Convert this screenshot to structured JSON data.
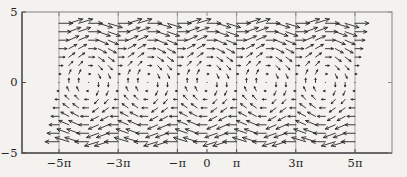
{
  "figure": {
    "width": 407,
    "height": 177,
    "background": "#f3f2ef",
    "plot_box": {
      "left": 22,
      "top": 12,
      "right": 392,
      "bottom": 153
    },
    "colors": {
      "arrow": "#262626",
      "grid": "#9b9b9b",
      "box_light": "#8c8c8c",
      "box_dark": "#4d4d4d",
      "label": "#1f1f1f"
    },
    "tick_length_px": 4,
    "label_font_px": 11.5
  },
  "chart_data": {
    "type": "quiver",
    "title": "",
    "xlabel": "",
    "ylabel": "",
    "field": {
      "u_expr": "y",
      "v_expr": "-sin(x)"
    },
    "grid": {
      "x_start_pi": -5,
      "x_step_pi": 0.33333333,
      "x_count": 31,
      "y_start": -4.2,
      "y_step": 0.6,
      "y_count": 15
    },
    "xlim_pi": [
      -6.25,
      6.25
    ],
    "ylim": [
      -5,
      5
    ],
    "x_ticks": [
      {
        "label": "−5π",
        "value_pi": -5
      },
      {
        "label": "−3π",
        "value_pi": -3
      },
      {
        "label": "−π",
        "value_pi": -1
      },
      {
        "label": "0",
        "value_pi": 0
      },
      {
        "label": "π",
        "value_pi": 1
      },
      {
        "label": "3π",
        "value_pi": 3
      },
      {
        "label": "5π",
        "value_pi": 5
      }
    ],
    "y_ticks": [
      {
        "label": "5",
        "value": 5
      },
      {
        "label": "0",
        "value": 0
      },
      {
        "label": "−5",
        "value": -5
      }
    ],
    "x_gridlines_pi": [
      -5,
      -3,
      -1,
      1,
      3,
      5
    ],
    "grid_on_y": false,
    "legend": "none",
    "arrow_scale": 0.35,
    "arrow_stroke_px": 0.9,
    "head": {
      "frac": 0.3,
      "min_px": 1.6,
      "max_px": 4.4,
      "angle_deg": 26
    }
  }
}
